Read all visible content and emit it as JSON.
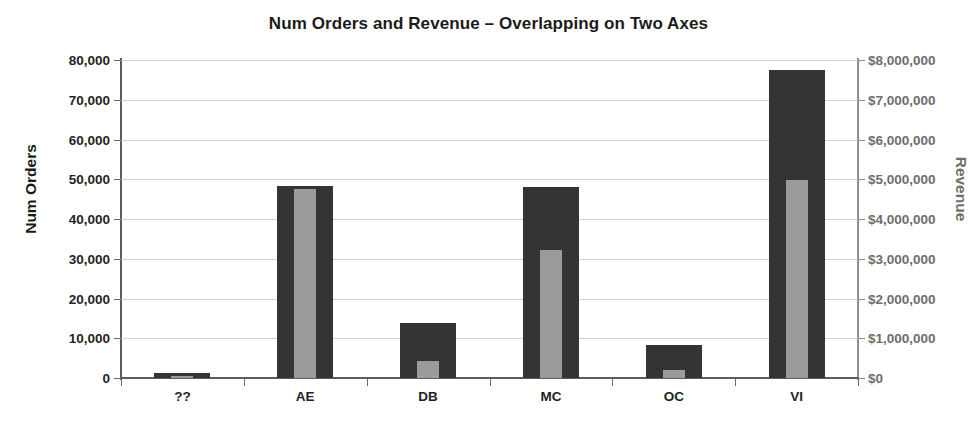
{
  "chart_data": {
    "type": "bar",
    "title": "Num Orders and Revenue – Overlapping on Two Axes",
    "categories": [
      "??",
      "AE",
      "DB",
      "MC",
      "OC",
      "VI"
    ],
    "xlabel": "",
    "ylabel": "Num Orders",
    "y2label": "Revenue",
    "ylim": [
      0,
      80000
    ],
    "y2lim": [
      0,
      8000000
    ],
    "grid": true,
    "legend": "none",
    "series": [
      {
        "name": "Num Orders",
        "axis": "left",
        "color": "#343434",
        "values": [
          1200,
          48300,
          13800,
          48000,
          8300,
          77600
        ]
      },
      {
        "name": "Revenue",
        "axis": "right",
        "color": "#9b9b9b",
        "values": [
          60000,
          4750000,
          430000,
          3230000,
          200000,
          4980000
        ]
      }
    ],
    "yticks": [
      0,
      10000,
      20000,
      30000,
      40000,
      50000,
      60000,
      70000,
      80000
    ],
    "ytick_labels": [
      "0",
      "10,000",
      "20,000",
      "30,000",
      "40,000",
      "50,000",
      "60,000",
      "70,000",
      "80,000"
    ],
    "y2ticks": [
      0,
      1000000,
      2000000,
      3000000,
      4000000,
      5000000,
      6000000,
      7000000,
      8000000
    ],
    "y2tick_labels": [
      "$0",
      "$1,000,000",
      "$2,000,000",
      "$3,000,000",
      "$4,000,000",
      "$5,000,000",
      "$6,000,000",
      "$7,000,000",
      "$8,000,000"
    ]
  }
}
